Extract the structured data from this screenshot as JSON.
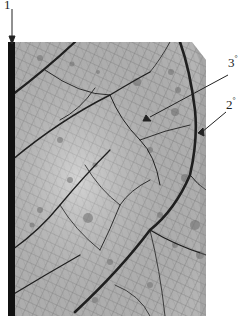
{
  "figure": {
    "colors": {
      "background": "#ffffff",
      "leaf_base": "#b8b8b8",
      "leaf_light": "#d9d9d9",
      "vein_dark": "#1a1a1a",
      "spot": "#6e6e6e",
      "annotation": "#222222"
    },
    "annotations": [
      {
        "id": "primary",
        "label": "1",
        "sup": "",
        "text_x": 5,
        "text_y": 2,
        "arrow_from": [
          12,
          8
        ],
        "arrow_to": [
          12,
          44
        ]
      },
      {
        "id": "tertiary",
        "label": "3",
        "sup": "°",
        "text_x": 203,
        "text_y": 57,
        "arrow_from": [
          228,
          75
        ],
        "arrow_to": [
          145,
          120
        ]
      },
      {
        "id": "secondary",
        "label": "2",
        "sup": "°",
        "text_x": 203,
        "text_y": 100,
        "arrow_from": [
          226,
          112
        ],
        "arrow_to": [
          198,
          136
        ]
      }
    ]
  }
}
